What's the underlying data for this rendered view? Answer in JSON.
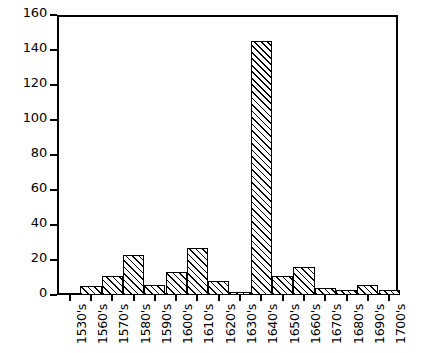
{
  "chart_data": {
    "type": "bar",
    "title": "",
    "subtitle": "",
    "xlabel": "",
    "ylabel": "",
    "categories": [
      "1530's",
      "1560's",
      "1570's",
      "1580's",
      "1590's",
      "1600's",
      "1610's",
      "1620's",
      "1630's",
      "1640's",
      "1650's",
      "1660's",
      "1670's",
      "1680's",
      "1690's",
      "1700's"
    ],
    "values": [
      1,
      5,
      11,
      23,
      6,
      13,
      27,
      8,
      2,
      145,
      11,
      16,
      4,
      3,
      6,
      3
    ],
    "ylim": [
      0,
      160
    ],
    "ytick_labels": [
      "0",
      "20",
      "40",
      "60",
      "80",
      "100",
      "120",
      "140",
      "160"
    ],
    "ytick_values": [
      0,
      20,
      40,
      60,
      80,
      100,
      120,
      140,
      160
    ],
    "grid": false,
    "legend": null,
    "legend_position": "none",
    "bar_style": {
      "fill": "#ffffff",
      "edge_color": "#000000",
      "hatch": "diagonal-forward-slash"
    },
    "axis_color": "#000000",
    "background": "#ffffff"
  }
}
